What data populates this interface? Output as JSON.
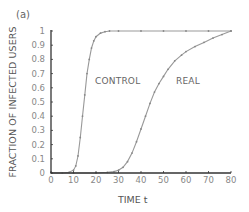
{
  "panel_label": "(a)",
  "chart_data": {
    "type": "line",
    "title": "",
    "xlabel": "TIME t",
    "ylabel": "FRACTION OF INFECTED USERS",
    "xlim": [
      0,
      80
    ],
    "ylim": [
      0,
      1
    ],
    "x_ticks": [
      "0",
      "10",
      "20",
      "30",
      "40",
      "50",
      "60",
      "70",
      "80"
    ],
    "y_ticks": [
      "0",
      "0.1",
      "0.2",
      "0.3",
      "0.4",
      "0.5",
      "0.6",
      "0.7",
      "0.8",
      "0.9",
      "1"
    ],
    "grid": false,
    "legend": "none (inline annotations)",
    "annotations": [
      {
        "text": "CONTROL",
        "near": "control curve, right side at y≈0.65"
      },
      {
        "text": "REAL",
        "near": "real curve, right side at y≈0.65"
      }
    ],
    "series": [
      {
        "name": "CONTROL",
        "x": [
          0,
          5,
          8,
          10,
          11,
          12,
          13,
          14,
          15,
          16,
          17,
          18,
          19,
          20,
          22,
          24,
          26,
          30,
          40,
          50,
          60,
          70,
          80
        ],
        "y": [
          0,
          0,
          0.005,
          0.02,
          0.05,
          0.12,
          0.25,
          0.4,
          0.55,
          0.7,
          0.8,
          0.88,
          0.93,
          0.96,
          0.985,
          0.995,
          1,
          1,
          1,
          1,
          1,
          1,
          1
        ]
      },
      {
        "name": "REAL",
        "x": [
          0,
          10,
          20,
          25,
          28,
          30,
          32,
          34,
          36,
          38,
          40,
          42,
          44,
          46,
          48,
          50,
          52,
          55,
          58,
          60,
          64,
          68,
          72,
          76,
          80
        ],
        "y": [
          0,
          0,
          0,
          0.005,
          0.01,
          0.02,
          0.04,
          0.08,
          0.14,
          0.22,
          0.31,
          0.4,
          0.49,
          0.57,
          0.63,
          0.68,
          0.73,
          0.79,
          0.83,
          0.855,
          0.89,
          0.92,
          0.95,
          0.975,
          1
        ]
      }
    ]
  },
  "colors": {
    "axis": "#333333",
    "tick_label": "#888888",
    "curve": "#999999",
    "marker": "#888888"
  }
}
